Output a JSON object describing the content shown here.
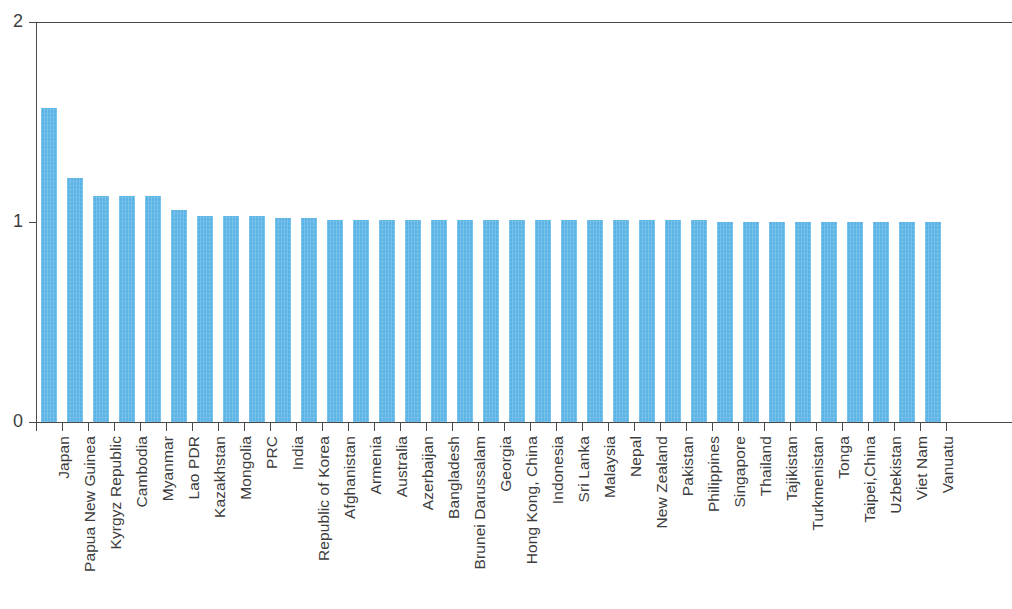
{
  "chart_data": {
    "type": "bar",
    "title": "",
    "subtitle": "",
    "xlabel": "",
    "ylabel": "",
    "ylim": [
      0,
      2
    ],
    "y_ticks": [
      "0",
      "1",
      "2"
    ],
    "y_tick_values": [
      0,
      1,
      2
    ],
    "grid": false,
    "legend": null,
    "bar_color": "#5cb4e6",
    "axis_color": "#4a4a4a",
    "categories": [
      "Japan",
      "Papua New Guinea",
      "Kyrgyz Republic",
      "Cambodia",
      "Myanmar",
      "Lao PDR",
      "Kazakhstan",
      "Mongolia",
      "PRC",
      "India",
      "Republic of Korea",
      "Afghanistan",
      "Armenia",
      "Australia",
      "Azerbaijan",
      "Bangladesh",
      "Brunei Darussalam",
      "Georgia",
      "Hong Kong, China",
      "Indonesia",
      "Sri Lanka",
      "Malaysia",
      "Nepal",
      "New Zealand",
      "Pakistan",
      "Philippines",
      "Singapore",
      "Thailand",
      "Tajikistan",
      "Turkmenistan",
      "Tonga",
      "Taipei,China",
      "Uzbekistan",
      "Viet Nam",
      "Vanuatu"
    ],
    "values": [
      1.57,
      1.22,
      1.13,
      1.13,
      1.13,
      1.06,
      1.03,
      1.03,
      1.03,
      1.02,
      1.02,
      1.01,
      1.01,
      1.01,
      1.01,
      1.01,
      1.01,
      1.01,
      1.01,
      1.01,
      1.01,
      1.01,
      1.01,
      1.01,
      1.01,
      1.01,
      1.0,
      1.0,
      1.0,
      1.0,
      1.0,
      1.0,
      1.0,
      1.0,
      1.0
    ]
  }
}
